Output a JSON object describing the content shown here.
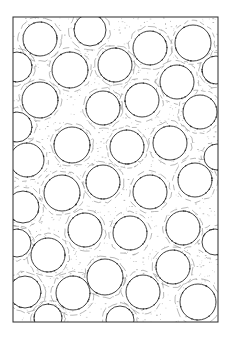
{
  "figure": {
    "type": "micrograph-illustration",
    "frame": {
      "x": 13,
      "y": 17,
      "width": 205,
      "height": 305
    },
    "colors": {
      "line": "#2a2a2a",
      "stipple": "#8a8a8a",
      "background": "#ffffff",
      "wave": "#9a9a9a"
    },
    "circles": [
      {
        "cx": 40,
        "cy": 39,
        "r": 17
      },
      {
        "cx": 90,
        "cy": 30,
        "r": 16
      },
      {
        "cx": 150,
        "cy": 48,
        "r": 17
      },
      {
        "cx": 193,
        "cy": 43,
        "r": 18
      },
      {
        "cx": 17,
        "cy": 67,
        "r": 15
      },
      {
        "cx": 70,
        "cy": 70,
        "r": 18
      },
      {
        "cx": 115,
        "cy": 65,
        "r": 17
      },
      {
        "cx": 177,
        "cy": 82,
        "r": 17
      },
      {
        "cx": 216,
        "cy": 70,
        "r": 14
      },
      {
        "cx": 40,
        "cy": 100,
        "r": 18
      },
      {
        "cx": 103,
        "cy": 108,
        "r": 17
      },
      {
        "cx": 142,
        "cy": 100,
        "r": 17
      },
      {
        "cx": 200,
        "cy": 112,
        "r": 17
      },
      {
        "cx": 17,
        "cy": 127,
        "r": 15
      },
      {
        "cx": 72,
        "cy": 145,
        "r": 18
      },
      {
        "cx": 127,
        "cy": 147,
        "r": 17
      },
      {
        "cx": 170,
        "cy": 143,
        "r": 17
      },
      {
        "cx": 217,
        "cy": 157,
        "r": 13
      },
      {
        "cx": 27,
        "cy": 160,
        "r": 17
      },
      {
        "cx": 103,
        "cy": 182,
        "r": 17
      },
      {
        "cx": 195,
        "cy": 180,
        "r": 17
      },
      {
        "cx": 62,
        "cy": 193,
        "r": 18
      },
      {
        "cx": 150,
        "cy": 192,
        "r": 17
      },
      {
        "cx": 23,
        "cy": 207,
        "r": 16
      },
      {
        "cx": 85,
        "cy": 230,
        "r": 17
      },
      {
        "cx": 130,
        "cy": 233,
        "r": 17
      },
      {
        "cx": 183,
        "cy": 228,
        "r": 17
      },
      {
        "cx": 17,
        "cy": 243,
        "r": 14
      },
      {
        "cx": 215,
        "cy": 242,
        "r": 13
      },
      {
        "cx": 48,
        "cy": 255,
        "r": 17
      },
      {
        "cx": 173,
        "cy": 267,
        "r": 17
      },
      {
        "cx": 105,
        "cy": 277,
        "r": 18
      },
      {
        "cx": 25,
        "cy": 292,
        "r": 16
      },
      {
        "cx": 73,
        "cy": 293,
        "r": 17
      },
      {
        "cx": 143,
        "cy": 292,
        "r": 17
      },
      {
        "cx": 198,
        "cy": 302,
        "r": 18
      },
      {
        "cx": 48,
        "cy": 318,
        "r": 14
      },
      {
        "cx": 120,
        "cy": 320,
        "r": 14
      }
    ]
  }
}
